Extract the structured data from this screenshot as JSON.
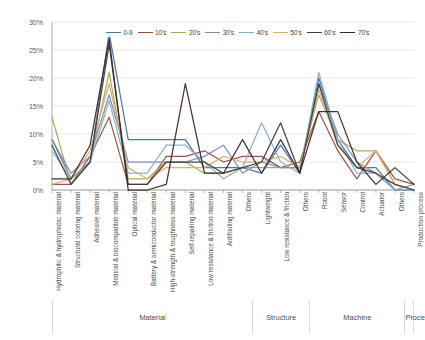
{
  "chart_data": {
    "type": "line",
    "title": "",
    "xlabel": "",
    "ylabel": "",
    "ylim": [
      0,
      30
    ],
    "yticks": [
      0,
      5,
      10,
      15,
      20,
      25,
      30
    ],
    "ytick_labels": [
      "0%",
      "5%",
      "10%",
      "15%",
      "20%",
      "25%",
      "30%"
    ],
    "grid": true,
    "legend_position": "top-center",
    "categories": [
      "Hydrophilic & hydrophobic material",
      "Structural coloring material",
      "Adhesive material",
      "Medical & biocompatible material",
      "Optical material",
      "Battery & semiconductor material",
      "High-strength & toughness material",
      "Self-repairing material",
      "Low resistance & friction material",
      "Antifouling material",
      "Others",
      "Lightweight",
      "Low resistance & friction",
      "Others",
      "Robot",
      "Sensor",
      "Control",
      "Actuator",
      "Others",
      "Production process"
    ],
    "groups": [
      {
        "label": "Material",
        "start": 0,
        "end": 10
      },
      {
        "label": "Structure",
        "start": 11,
        "end": 13
      },
      {
        "label": "Machine",
        "start": 14,
        "end": 18
      },
      {
        "label": "Process",
        "start": 19,
        "end": 19
      }
    ],
    "series": [
      {
        "name": "0-9",
        "color": "#4472a8",
        "values": [
          9.0,
          2.0,
          5.0,
          28.0,
          9.0,
          9.0,
          9.0,
          9.0,
          4.0,
          4.0,
          4.0,
          3.0,
          8.0,
          3.0,
          20.0,
          9.0,
          4.0,
          4.0,
          0.0,
          0.0
        ]
      },
      {
        "name": "10's",
        "color": "#9e4a41",
        "values": [
          1.0,
          1.0,
          6.0,
          13.0,
          1.0,
          1.0,
          6.0,
          6.0,
          7.0,
          5.0,
          6.0,
          6.0,
          4.0,
          5.0,
          14.0,
          7.0,
          2.0,
          7.0,
          2.0,
          1.0
        ]
      },
      {
        "name": "20's",
        "color": "#b5a24a",
        "values": [
          13.0,
          1.0,
          5.0,
          21.0,
          2.0,
          2.0,
          5.0,
          5.0,
          3.0,
          3.0,
          4.0,
          4.0,
          4.0,
          4.0,
          17.0,
          9.0,
          7.0,
          7.0,
          1.0,
          0.0
        ]
      },
      {
        "name": "30's",
        "color": "#7b8bb2",
        "values": [
          9.0,
          3.0,
          6.0,
          17.0,
          5.0,
          5.0,
          5.0,
          5.0,
          6.0,
          8.0,
          3.0,
          5.0,
          4.0,
          4.0,
          19.0,
          10.0,
          5.0,
          3.0,
          0.0,
          1.0
        ]
      },
      {
        "name": "40's",
        "color": "#7fb0d4",
        "values": [
          7.0,
          2.0,
          5.0,
          16.0,
          3.0,
          3.0,
          8.0,
          8.0,
          5.0,
          2.0,
          4.0,
          12.0,
          5.0,
          3.0,
          21.0,
          9.0,
          3.0,
          3.0,
          0.0,
          0.0
        ]
      },
      {
        "name": "50's",
        "color": "#d9ad6a",
        "values": [
          1.0,
          2.0,
          7.0,
          19.0,
          4.0,
          2.0,
          4.0,
          4.0,
          4.0,
          6.0,
          5.0,
          5.0,
          6.0,
          4.0,
          18.0,
          8.0,
          4.0,
          7.0,
          1.0,
          0.0
        ]
      },
      {
        "name": "60's",
        "color": "#3b3b3b",
        "values": [
          8.0,
          1.0,
          5.0,
          26.0,
          1.0,
          1.0,
          5.0,
          5.0,
          5.0,
          3.0,
          4.0,
          5.0,
          12.0,
          3.0,
          19.0,
          8.0,
          4.0,
          3.0,
          1.0,
          0.0
        ]
      },
      {
        "name": "70's",
        "color": "#3d2626",
        "values": [
          2.0,
          2.0,
          8.0,
          27.0,
          0.0,
          0.0,
          1.0,
          19.0,
          3.0,
          3.0,
          9.0,
          3.0,
          9.0,
          3.0,
          14.0,
          14.0,
          5.0,
          1.0,
          4.0,
          1.0
        ]
      }
    ]
  },
  "axis": {
    "y_top_label": "30%",
    "grid_color": "#e3e3e3",
    "axis_color": "#9a9a9a"
  }
}
